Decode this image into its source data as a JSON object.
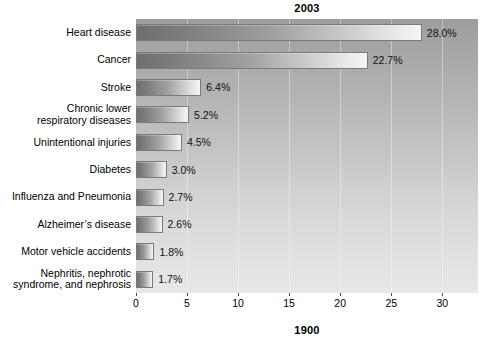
{
  "chart_data": {
    "type": "bar",
    "orientation": "horizontal",
    "title": "2003",
    "bottom_title": "1900",
    "xlabel": "",
    "ylabel": "",
    "xlim": [
      0,
      33.5
    ],
    "xticks": [
      0,
      5,
      10,
      15,
      20,
      25,
      30
    ],
    "xtick_labels": [
      "0",
      "5",
      "10",
      "15",
      "20",
      "25",
      "30"
    ],
    "grid": true,
    "legend": "none",
    "categories": [
      "Heart disease",
      "Cancer",
      "Stroke",
      "Chronic lower respiratory diseases",
      "Unintentional injuries",
      "Diabetes",
      "Influenza and Pneumonia",
      "Alzheimer's disease",
      "Motor vehicle accidents",
      "Nephritis, nephrotic syndrome, and nephrosis"
    ],
    "category_lines": [
      [
        "Heart disease"
      ],
      [
        "Cancer"
      ],
      [
        "Stroke"
      ],
      [
        "Chronic lower",
        "respiratory diseases"
      ],
      [
        "Unintentional injuries"
      ],
      [
        "Diabetes"
      ],
      [
        "Influenza and Pneumonia"
      ],
      [
        "Alzheimer’s disease"
      ],
      [
        "Motor vehicle accidents"
      ],
      [
        "Nephritis, nephrotic",
        "syndrome, and nephrosis"
      ]
    ],
    "values": [
      28.0,
      22.7,
      6.4,
      5.2,
      4.5,
      3.0,
      2.7,
      2.6,
      1.8,
      1.7
    ],
    "value_labels": [
      "28.0%",
      "22.7%",
      "6.4%",
      "5.2%",
      "4.5%",
      "3.0%",
      "2.7%",
      "2.6%",
      "1.8%",
      "1.7%"
    ]
  },
  "colors": {
    "plot_background_top": "#9d9d9d",
    "plot_background_bottom": "#e7e7e7",
    "bar_fill_dark": "#6e6e6e",
    "bar_fill_light": "#f4f4f4",
    "bar_border": "#7a7a7a",
    "text": "#000000",
    "page_background": "#ffffff"
  }
}
